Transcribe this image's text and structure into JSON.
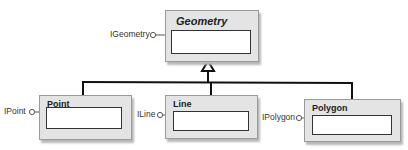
{
  "diagram": {
    "type": "UML class inheritance diagram",
    "base_class": {
      "name": "Geometry",
      "abstract": true,
      "interface": "IGeometry"
    },
    "subclasses": [
      {
        "name": "Point",
        "interface": "IPoint"
      },
      {
        "name": "Line",
        "interface": "ILine"
      },
      {
        "name": "Polygon",
        "interface": "IPolygon"
      }
    ],
    "relationship": "generalization"
  }
}
